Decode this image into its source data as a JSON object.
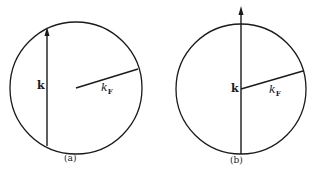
{
  "figure": {
    "panels": [
      {
        "id": "a",
        "caption": "(a)",
        "vector_label": "k",
        "radius_label": "k",
        "radius_subscript": "F",
        "description": "Fermi sphere with wave vector k displaced off-center"
      },
      {
        "id": "b",
        "caption": "(b)",
        "vector_label": "k",
        "radius_label": "k",
        "radius_subscript": "F",
        "description": "Fermi sphere with wave vector k through center"
      }
    ],
    "colors": {
      "stroke": "#1a1a1a",
      "background": "#ffffff"
    }
  }
}
